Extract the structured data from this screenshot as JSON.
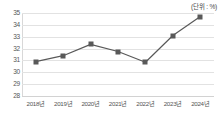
{
  "unit_label": "(단위 : %)",
  "chart_data": {
    "type": "line",
    "title": "",
    "subtitle": "",
    "xlabel": "",
    "ylabel": "",
    "unit": "%",
    "unit_note": "(단위 : %)",
    "categories": [
      "2018년",
      "2019년",
      "2020년",
      "2021년",
      "2022년",
      "2023년",
      "2024년"
    ],
    "values": [
      30.9,
      31.4,
      32.35,
      31.75,
      30.85,
      33.1,
      34.7
    ],
    "series": [
      {
        "name": "",
        "values": [
          30.9,
          31.4,
          32.35,
          31.75,
          30.85,
          33.1,
          34.7
        ]
      }
    ],
    "ylim": [
      28,
      35
    ],
    "yticks": [
      35,
      34,
      33,
      32,
      31,
      30,
      29,
      28
    ],
    "ytick_labels": [
      "35",
      "34",
      "33",
      "32",
      "31",
      "30",
      "29",
      "28"
    ],
    "xtick_labels": [
      "2018년",
      "2019년",
      "2020년",
      "2021년",
      "2022년",
      "2023년",
      "2024년"
    ],
    "grid": true,
    "legend": false,
    "legend_position": "none",
    "line_color": "#595959",
    "marker_color": "#595959",
    "marker_shape": "square",
    "grid_color": "#e2e2e2",
    "background_color": "#ffffff"
  }
}
